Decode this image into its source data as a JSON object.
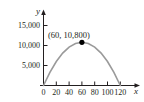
{
  "chart_data": {
    "type": "line",
    "title": "",
    "subtitle": "",
    "xlabel": "x",
    "ylabel": "y",
    "xlim": [
      0,
      130
    ],
    "ylim": [
      0,
      16500
    ],
    "grid": false,
    "legend": null,
    "x_ticks": [
      {
        "value": 0,
        "label": "0"
      },
      {
        "value": 20,
        "label": "20"
      },
      {
        "value": 40,
        "label": "40"
      },
      {
        "value": 60,
        "label": "60"
      },
      {
        "value": 80,
        "label": "80"
      },
      {
        "value": 100,
        "label": "100"
      },
      {
        "value": 120,
        "label": "120"
      }
    ],
    "y_ticks": [
      {
        "value": 5000,
        "label": "5,000"
      },
      {
        "value": 10000,
        "label": "10,000"
      },
      {
        "value": 15000,
        "label": "15,000"
      }
    ],
    "series": [
      {
        "name": "parabola",
        "color": "#9a9a9a",
        "vertex": {
          "x": 60,
          "y": 10800
        },
        "roots": [
          0,
          120
        ],
        "x": [
          0,
          10,
          20,
          30,
          40,
          50,
          60,
          70,
          80,
          90,
          100,
          110,
          120
        ],
        "values": [
          0,
          3300,
          6000,
          8100,
          9600,
          10500,
          10800,
          10500,
          9600,
          8100,
          6000,
          3300,
          0
        ]
      }
    ],
    "annotations": [
      {
        "name": "vertex-label",
        "text": "(60, 10,800)",
        "x": 60,
        "y": 10800,
        "marker": "filled-circle",
        "marker_color": "#000000"
      }
    ]
  },
  "axes": {
    "y_axis_name": "y",
    "x_axis_name": "x"
  }
}
